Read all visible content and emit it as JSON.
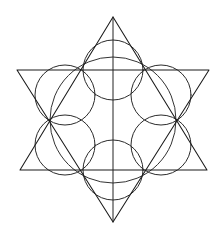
{
  "figure": {
    "background_color": "#ffffff",
    "stroke_color": "#1a1a1a",
    "arc_color": "#2b2b2b",
    "canvas": {
      "width": 224,
      "height": 238
    },
    "center": {
      "x": 113,
      "y": 120
    }
  },
  "chart_data": {
    "type": "scatter",
    "xlabel": "",
    "ylabel": "",
    "xlim": [
      0,
      224
    ],
    "ylim": [
      0,
      238
    ],
    "grid": false,
    "legend": "none",
    "center": {
      "x": 113,
      "y": 120
    },
    "categories": [
      "upward-triangle",
      "downward-triangle",
      "inscribed-circle",
      "lobe-arcs",
      "vertical-axis"
    ],
    "values": [
      3,
      3,
      1,
      6,
      1
    ],
    "star_points": [
      {
        "name": "top-apex",
        "x": 113,
        "y": 17
      },
      {
        "name": "upper-right",
        "x": 209,
        "y": 70
      },
      {
        "name": "lower-right",
        "x": 207,
        "y": 170
      },
      {
        "name": "bottom-apex",
        "x": 113,
        "y": 222
      },
      {
        "name": "lower-left",
        "x": 20,
        "y": 170
      },
      {
        "name": "upper-left",
        "x": 17,
        "y": 70
      }
    ],
    "hexagon_vertices": [
      {
        "name": "hex-top-right",
        "x": 145,
        "y": 70
      },
      {
        "name": "hex-right",
        "x": 177,
        "y": 120
      },
      {
        "name": "hex-bottom-right",
        "x": 145,
        "y": 170
      },
      {
        "name": "hex-bottom-left",
        "x": 81,
        "y": 170
      },
      {
        "name": "hex-left",
        "x": 49,
        "y": 120
      },
      {
        "name": "hex-top-left",
        "x": 81,
        "y": 70
      }
    ],
    "inscribed_circle": {
      "cx": 113,
      "cy": 120,
      "r": 63
    },
    "lobe_radius": 30,
    "series": [
      {
        "name": "upward-triangle",
        "points": [
          {
            "x": 113,
            "y": 17
          },
          {
            "x": 207,
            "y": 170
          },
          {
            "x": 20,
            "y": 170
          }
        ]
      },
      {
        "name": "downward-triangle",
        "points": [
          {
            "x": 113,
            "y": 222
          },
          {
            "x": 17,
            "y": 70
          },
          {
            "x": 209,
            "y": 70
          }
        ]
      },
      {
        "name": "vertical-axis",
        "points": [
          {
            "x": 113,
            "y": 17
          },
          {
            "x": 113,
            "y": 222
          }
        ]
      }
    ]
  },
  "labels": {
    "caption": ""
  }
}
